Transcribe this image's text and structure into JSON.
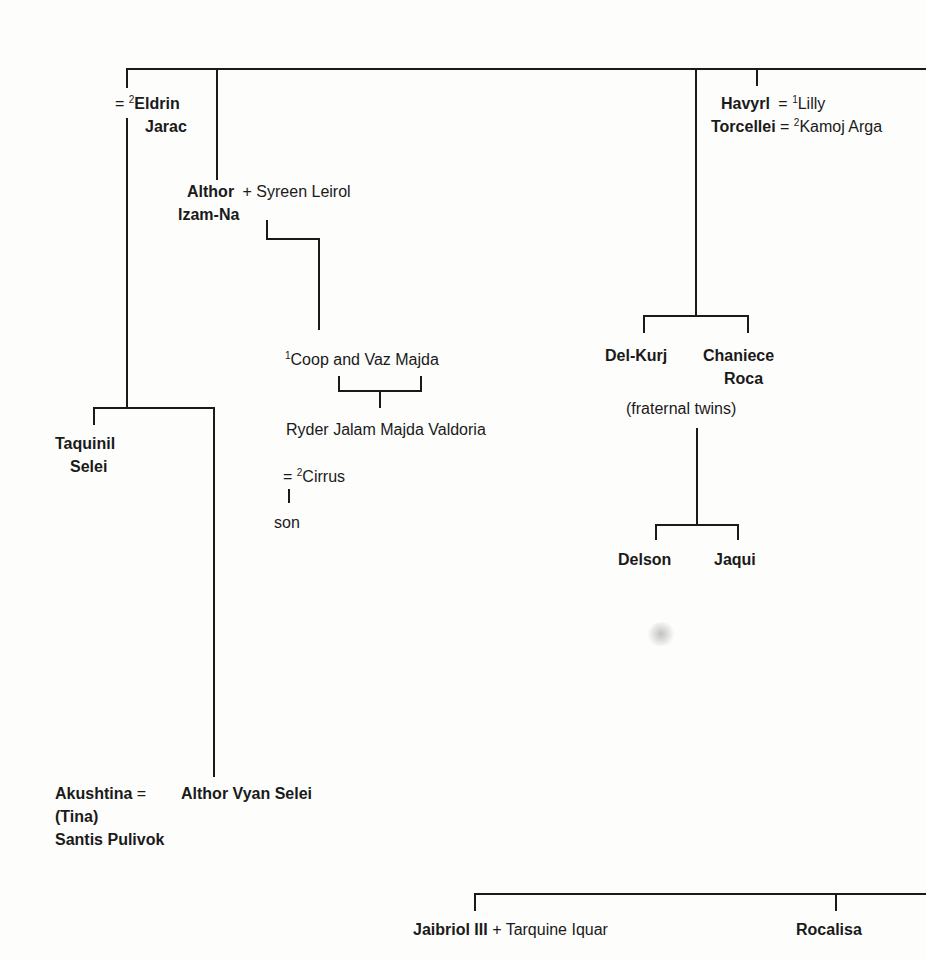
{
  "diagram": {
    "type": "family-tree",
    "people": {
      "eldrin": {
        "prefix": "= ",
        "sup": "2",
        "first": "Eldrin",
        "last": "Jarac"
      },
      "althor_izam": {
        "line1": "Althor",
        "line2": "Izam-Na",
        "partner": "+ Syreen Leirol"
      },
      "havyrl": {
        "line1": "Havyrl",
        "line2": "Torcellei",
        "spouse1_prefix": " = ",
        "spouse1_sup": "1",
        "spouse1": "Lilly",
        "spouse2_prefix": " = ",
        "spouse2_sup": "2",
        "spouse2": "Kamoj Arga"
      },
      "coop_vaz": {
        "sup": "1",
        "name": "Coop and Vaz Majda"
      },
      "ryder": {
        "name": "Ryder Jalam Majda Valdoria"
      },
      "cirrus": {
        "prefix": "= ",
        "sup": "2",
        "name": "Cirrus"
      },
      "son": {
        "name": "son"
      },
      "delkurj": {
        "name": "Del-Kurj"
      },
      "chaniece": {
        "line1": "Chaniece",
        "line2": "Roca"
      },
      "twins_note": {
        "text": "(fraternal twins)"
      },
      "delson": {
        "name": "Delson"
      },
      "jaqui": {
        "name": "Jaqui"
      },
      "taquinil": {
        "line1": "Taquinil",
        "line2": "Selei"
      },
      "akushtina": {
        "line1": "Akushtina",
        "eq": " = ",
        "line2": "(Tina)",
        "line3": "Santis Pulivok"
      },
      "althor_vyan": {
        "name": "Althor Vyan Selei"
      },
      "jaibriol": {
        "name": "Jaibriol III",
        "partner": " + Tarquine Iquar"
      },
      "rocalisa": {
        "name": "Rocalisa"
      }
    }
  }
}
